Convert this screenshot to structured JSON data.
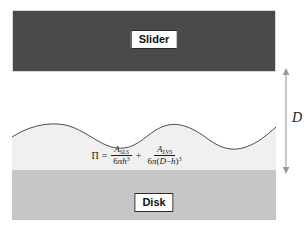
{
  "figure": {
    "background_color": "#ffffff"
  },
  "slider": {
    "label": "Slider",
    "fill_color": "#4a4a4a"
  },
  "gap": {
    "label": "air gap",
    "fill_color": "#ffffff"
  },
  "liquid": {
    "label": "lubricant film",
    "fill_color": "#f0f0f0",
    "curve_color": "#3a3a3a"
  },
  "disk": {
    "label": "Disk",
    "fill_color": "#c6c6c6"
  },
  "dimension": {
    "label": "D",
    "arrow_color": "#9a9a9a",
    "description": "double-headed vertical arrow spanning slider bottom to disk top"
  },
  "equation": {
    "lhs": "Π",
    "equals": "=",
    "plus": "+",
    "term1": {
      "numerator_symbol": "A",
      "numerator_subscript": "SLS",
      "denominator_prefix": "6",
      "denominator_pi": "π",
      "denominator_var": "h",
      "denominator_exponent": "3"
    },
    "term2": {
      "numerator_symbol": "A",
      "numerator_subscript": "LVS",
      "denominator_prefix": "6",
      "denominator_pi": "π",
      "denominator_open": "(",
      "denominator_var1": "D",
      "denominator_minus": "−",
      "denominator_var2": "h",
      "denominator_close": ")",
      "denominator_exponent": "3"
    },
    "plain_text": "Π = A_SLS / (6πh³) + A_LVS / (6π(D−h)³)"
  }
}
